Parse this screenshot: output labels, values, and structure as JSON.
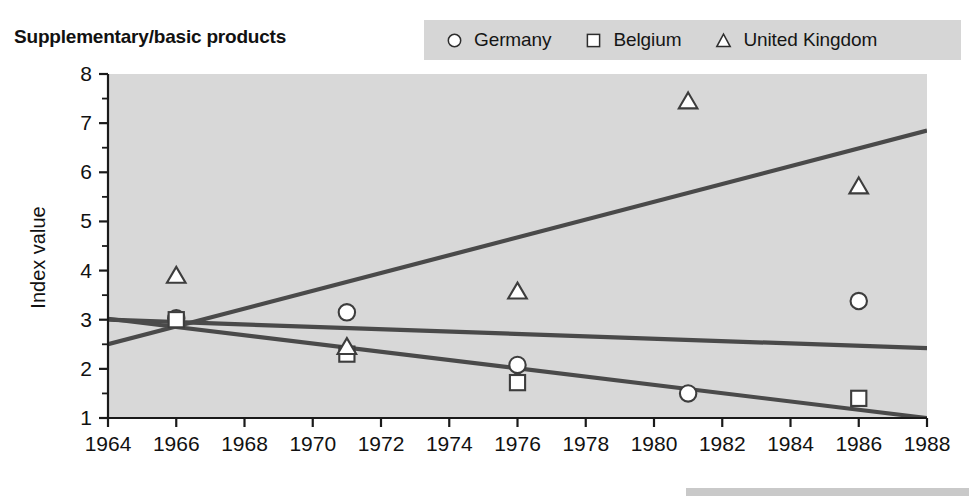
{
  "title": "Supplementary/basic products",
  "legend": {
    "position": "top-right",
    "background": "#d6d6d6",
    "entries": [
      {
        "label": "Germany",
        "marker": "circle-marker-icon"
      },
      {
        "label": "Belgium",
        "marker": "square-marker-icon"
      },
      {
        "label": "United Kingdom",
        "marker": "triangle-marker-icon"
      }
    ]
  },
  "axes": {
    "ylabel": "Index value",
    "xlabel": "",
    "yticks": [
      "1",
      "2",
      "3",
      "4",
      "5",
      "6",
      "7",
      "8"
    ],
    "xticks": [
      "1964",
      "1966",
      "1968",
      "1970",
      "1972",
      "1974",
      "1976",
      "1978",
      "1980",
      "1982",
      "1984",
      "1986",
      "1988"
    ]
  },
  "colors": {
    "plot_background": "#d8d8d8",
    "line": "#4a4a4a",
    "marker_fill": "#ffffff",
    "marker_stroke": "#3d3d3d",
    "axis": "#1a1a1a",
    "legend_background": "#d6d6d6"
  },
  "chart_data": {
    "type": "scatter",
    "title": "Supplementary/basic products",
    "xlabel": "",
    "ylabel": "Index value",
    "xlim": [
      1964,
      1988
    ],
    "ylim": [
      1,
      8
    ],
    "grid": false,
    "legend_position": "top-right",
    "xticks": [
      1964,
      1966,
      1968,
      1970,
      1972,
      1974,
      1976,
      1978,
      1980,
      1982,
      1984,
      1986,
      1988
    ],
    "yticks": [
      1,
      2,
      3,
      4,
      5,
      6,
      7,
      8
    ],
    "minor_yticks": [
      1.5,
      2.5,
      3.5,
      4.5,
      5.5,
      6.5,
      7.5
    ],
    "x": [
      1966,
      1971,
      1976,
      1981,
      1986
    ],
    "series": [
      {
        "name": "Germany",
        "marker": "circle",
        "x": [
          1966,
          1971,
          1976,
          1981,
          1986
        ],
        "values": [
          3.03,
          3.15,
          2.08,
          1.5,
          3.38
        ],
        "trendline": {
          "x": [
            1964,
            1988
          ],
          "y": [
            3.0,
            2.42
          ]
        }
      },
      {
        "name": "Belgium",
        "marker": "square",
        "x": [
          1966,
          1971,
          1976,
          1986
        ],
        "values": [
          3.0,
          2.3,
          1.72,
          1.4
        ],
        "trendline": {
          "x": [
            1964,
            1988
          ],
          "y": [
            3.02,
            1.0
          ]
        }
      },
      {
        "name": "United Kingdom",
        "marker": "triangle",
        "x": [
          1966,
          1971,
          1976,
          1981,
          1986
        ],
        "values": [
          3.9,
          2.45,
          3.58,
          7.45,
          5.72
        ],
        "trendline": {
          "x": [
            1964,
            1988
          ],
          "y": [
            2.5,
            6.85
          ]
        }
      }
    ]
  }
}
